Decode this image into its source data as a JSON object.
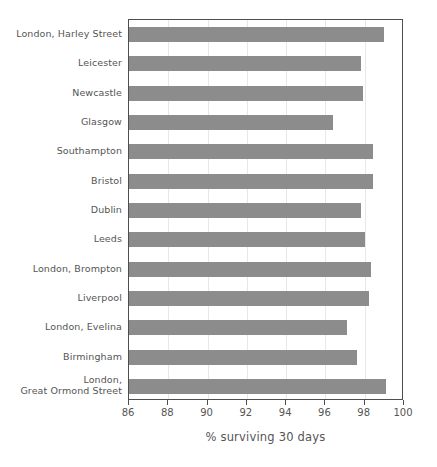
{
  "chart_data": {
    "type": "bar",
    "orientation": "horizontal",
    "title": "",
    "subtitle": "",
    "xlabel": "% surviving 30 days",
    "ylabel": "",
    "xlim": [
      86,
      100
    ],
    "ylim": null,
    "xticks": [
      86,
      88,
      90,
      92,
      94,
      96,
      98,
      100
    ],
    "xtick_labels": [
      "86",
      "88",
      "90",
      "92",
      "94",
      "96",
      "98",
      "100"
    ],
    "grid": "vertical",
    "legend": null,
    "legend_position": "none",
    "bar_color": "#8c8c8c",
    "categories": [
      "London, Harley Street",
      "Leicester",
      "Newcastle",
      "Glasgow",
      "Southampton",
      "Bristol",
      "Dublin",
      "Leeds",
      "London, Brompton",
      "Liverpool",
      "London, Evelina",
      "Birmingham",
      "London,\nGreat Ormond Street"
    ],
    "values": [
      99.0,
      97.8,
      97.9,
      96.4,
      98.4,
      98.4,
      97.8,
      98.0,
      98.3,
      98.2,
      97.1,
      97.6,
      99.1
    ]
  },
  "axis": {
    "x_title": "% surviving 30 days"
  }
}
